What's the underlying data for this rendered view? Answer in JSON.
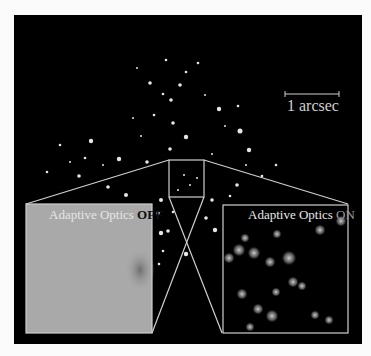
{
  "figure": {
    "scale_bar": {
      "label": "1 arcsec"
    },
    "panel_off": {
      "label_prefix": "Adaptive Optics ",
      "label_state": "OFF"
    },
    "panel_on": {
      "label_prefix": "Adaptive Optics ",
      "label_state": "ON"
    }
  },
  "colors": {
    "background": "#000000",
    "outline": "#cfcfcf",
    "blur_panel": "#a9a9a9",
    "page": "#fbfbfb"
  }
}
